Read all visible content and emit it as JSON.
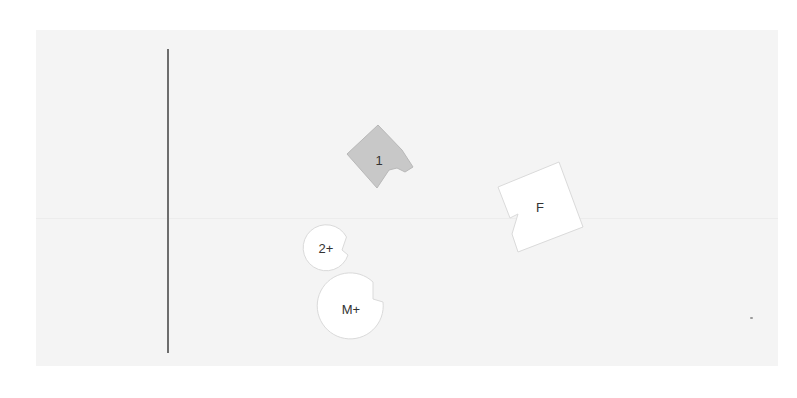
{
  "canvas": {
    "background": "#ffffff",
    "panel_color": "#f4f4f4",
    "divider_color": "#6d6d6d"
  },
  "pieces": [
    {
      "id": "piece-1",
      "label": "1",
      "shape": "notched-square",
      "fill": "#c8c8c8",
      "stroke": "#b5b5b5"
    },
    {
      "id": "piece-f",
      "label": "F",
      "shape": "notched-square",
      "fill": "#ffffff",
      "stroke": "#dcdcdc"
    },
    {
      "id": "piece-2plus",
      "label": "2+",
      "shape": "notched-circle",
      "fill": "#ffffff",
      "stroke": "#dcdcdc"
    },
    {
      "id": "piece-mplus",
      "label": "M+",
      "shape": "notched-circle",
      "fill": "#ffffff",
      "stroke": "#dcdcdc"
    }
  ]
}
